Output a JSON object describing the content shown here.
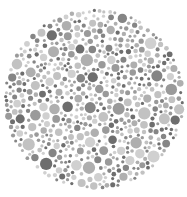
{
  "plate": {
    "type": "dot-pattern color vision test plate",
    "center": [
      94,
      99
    ],
    "radius": 91,
    "background": "#ffffff",
    "palette": [
      "#6e6e6e",
      "#858585",
      "#9a9a9a",
      "#afafaf",
      "#c2c2c2",
      "#d0d0d0"
    ],
    "seed": 20240611,
    "dot_count": 900,
    "min_r": 1.5,
    "max_r": 6.2
  }
}
